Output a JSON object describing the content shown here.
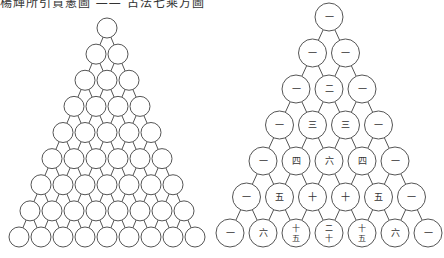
{
  "caption": "楊輝所引賈憲圖 —— 古法七乘方圖",
  "left_triangle": {
    "rows": 9,
    "apex": [
      107,
      28
    ],
    "bottom_y": 237,
    "dx": 22,
    "r": 10
  },
  "right_triangle": {
    "apex": [
      329,
      17
    ],
    "dy": 36,
    "dx": 33,
    "r": 14,
    "rows": [
      [
        "一"
      ],
      [
        "一",
        "一"
      ],
      [
        "一",
        "二",
        "一"
      ],
      [
        "一",
        "三",
        "三",
        "一"
      ],
      [
        "一",
        "四",
        "六",
        "四",
        "一"
      ],
      [
        "一",
        "五",
        "十",
        "十",
        "五",
        "一"
      ],
      [
        "一",
        "六",
        "十五",
        "二十",
        "十五",
        "六",
        "一"
      ]
    ]
  }
}
